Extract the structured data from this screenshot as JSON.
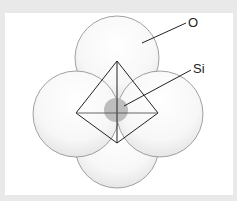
{
  "diagram": {
    "labels": {
      "oxygen": "O",
      "silicon": "Si"
    },
    "colors": {
      "background": "#e9e9e9",
      "panel": "#ffffff",
      "oxygen_fill": "#f4f4f4",
      "oxygen_stroke": "#8a8a8a",
      "silicon_fill": "#bdbdbd",
      "edge": "#222222"
    },
    "oxygen_atoms": [
      {
        "name": "top",
        "cx": 117,
        "cy": 58,
        "r": 42
      },
      {
        "name": "left",
        "cx": 76,
        "cy": 114,
        "r": 43
      },
      {
        "name": "right",
        "cx": 160,
        "cy": 114,
        "r": 43
      },
      {
        "name": "bottom",
        "cx": 117,
        "cy": 146,
        "r": 42
      }
    ],
    "silicon_atom": {
      "cx": 116,
      "cy": 110,
      "r": 12
    },
    "tetrahedron_vertices": {
      "apex": [
        117,
        61
      ],
      "left": [
        76,
        113
      ],
      "right": [
        158,
        113
      ],
      "bottom": [
        117,
        143
      ]
    }
  }
}
